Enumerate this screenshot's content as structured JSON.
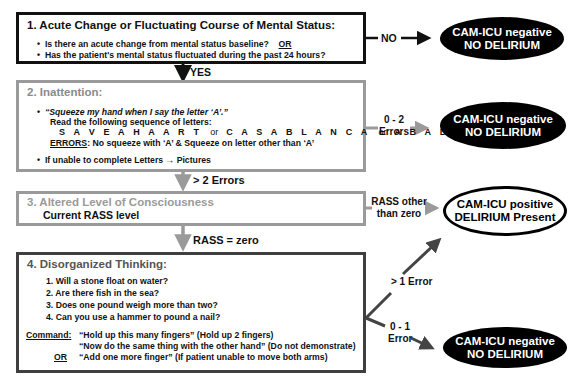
{
  "box1": {
    "title": "1. Acute Change or Fluctuating Course of Mental Status:",
    "items": [
      "Is there an acute change from mental status baseline?",
      "Has the patient's mental status fluctuated during the past 24 hours?"
    ],
    "or_label": "OR"
  },
  "box2": {
    "title": "2. Inattention:",
    "instruction": "“Squeeze my hand when I say the letter ‘A’.”",
    "read_line": "Read the following sequence of letters:",
    "sequences": [
      "S A V E A H A A R T",
      "C A S A B L A N C A",
      "A B A D B A D A A Y"
    ],
    "sequence_or": "or",
    "errors_label": "ERRORS",
    "errors_text": ": No squeeze with ‘A’ & Squeeze on letter other than ‘A’",
    "fallback": "If unable to complete Letters → Pictures"
  },
  "box3": {
    "title": "3. Altered Level of Consciousness",
    "subtitle": "Current RASS level"
  },
  "box4": {
    "title": "4. Disorganized Thinking:",
    "questions": [
      "1. Will a stone float on water?",
      "2. Are there fish in the sea?",
      "3. Does one pound weigh more than two?",
      "4. Can you use a hammer to pound a nail?"
    ],
    "command_label": "Command:",
    "command_1": "“Hold up this many fingers” (Hold up 2 fingers)",
    "command_2": "“Now do the same thing with the other hand” (Do not demonstrate)",
    "or_label": "OR",
    "command_3": "“Add one more finger” (If patient unable to move both arms)"
  },
  "connectors": {
    "yes": "YES",
    "no": "NO",
    "gt2_errors": "> 2 Errors",
    "errors_0_2_a": "0 - 2",
    "errors_0_2_b": "Errors",
    "rass_zero": "RASS = zero",
    "rass_other_a": "RASS other",
    "rass_other_b": "than zero",
    "gt1_error": "> 1 Error",
    "err_0_1_a": "0 - 1",
    "err_0_1_b": "Error"
  },
  "outcomes": {
    "negative_line1": "CAM-ICU negative",
    "negative_line2": "NO DELIRIUM",
    "positive_line1": "CAM-ICU positive",
    "positive_line2": "DELIRIUM Present"
  },
  "colors": {
    "box1_border": "#111111",
    "box2_border": "#9a9a9a",
    "box3_border": "#9a9a9a",
    "box4_border": "#3f3f3f",
    "gray_arrow": "#9a9a9a",
    "dark_arrow": "#444444"
  }
}
